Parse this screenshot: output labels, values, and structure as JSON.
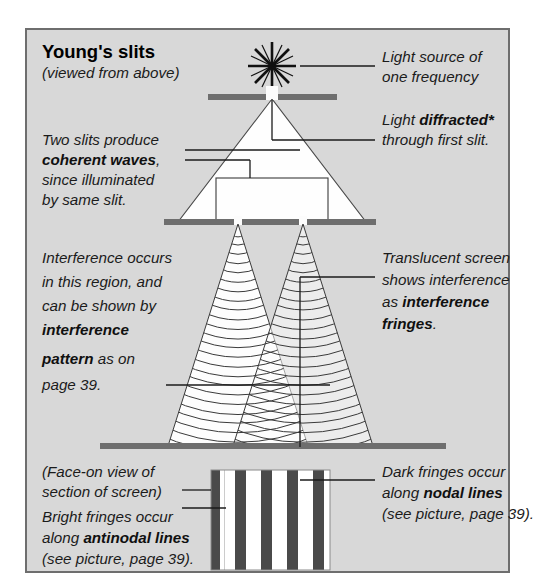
{
  "figure": {
    "title": "Young's slits",
    "subtitle": "(viewed from above)",
    "background_color": "#d7d7d7",
    "frame_color": "#6e6e6e",
    "bar_color": "#6e6e6e",
    "wave_color": "#3a3a3a",
    "fringe_dark_color": "#4a4a4a",
    "fringe_light_color": "#ffffff"
  },
  "annotations": {
    "light_source": {
      "name": "light-source-label",
      "lines": [
        "Light source of",
        "one frequency"
      ]
    },
    "diffraction": {
      "name": "diffraction-label",
      "line1_plain": "Light ",
      "line1_bold": "diffracted*",
      "line2": "through first slit."
    },
    "coherent": {
      "name": "coherent-waves-label",
      "line1": "Two slits produce",
      "line2_bold": "coherent waves",
      "line2_tail": ",",
      "line3": "since illuminated",
      "line4": "by same slit."
    },
    "interference_region": {
      "name": "interference-region-label",
      "line1": "Interference occurs",
      "line2": "in this region, and",
      "line3": "can be shown by",
      "line4_bold": "interference",
      "line5_bold": "pattern",
      "line5_tail": " as on",
      "line6": "page 39."
    },
    "translucent_screen": {
      "name": "translucent-screen-label",
      "line1": "Translucent screen",
      "line2": "shows interference",
      "line3_plain": "as ",
      "line3_bold": "interference",
      "line4_bold": "fringes",
      "line4_tail": "."
    },
    "face_on_view": {
      "name": "face-on-view-label",
      "line1": "(Face-on view of",
      "line2": "section of screen)"
    },
    "bright_fringes": {
      "name": "bright-fringes-label",
      "line1": "Bright fringes occur",
      "line2_plain": "along ",
      "line2_bold": "antinodal lines",
      "line3": "(see picture, page 39)."
    },
    "dark_fringes": {
      "name": "dark-fringes-label",
      "line1": "Dark fringes occur",
      "line2_plain": "along ",
      "line2_bold": "nodal lines",
      "line3": "(see picture, page 39)."
    }
  },
  "diagram": {
    "source_icon": "asterisk-star-icon",
    "first_barrier": {
      "x1": 208,
      "x2": 337,
      "y": 97,
      "slit_x": 272
    },
    "second_barrier": {
      "x1": 164,
      "x2": 376,
      "y": 222,
      "slit_left_x": 238,
      "slit_right_x": 303
    },
    "screen_bar": {
      "x1": 100,
      "x2": 446,
      "y": 446
    },
    "fringe_panel": {
      "x": 211,
      "y": 470,
      "width": 119,
      "height": 100,
      "dark_band_count": 7
    },
    "wave_arc_count_per_slit": 26
  }
}
